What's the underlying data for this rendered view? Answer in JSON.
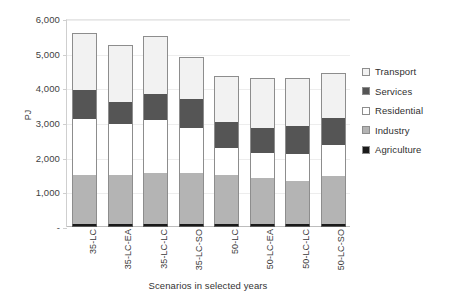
{
  "chart_data": {
    "type": "bar",
    "title": "",
    "subtitle": "",
    "xlabel": "Scenarios in selected years",
    "ylabel": "PJ",
    "ylim": [
      0,
      6000
    ],
    "ytick_values": [
      0,
      1000,
      2000,
      3000,
      4000,
      5000,
      6000
    ],
    "ytick_labels": [
      "-",
      "1,000",
      "2,000",
      "3,000",
      "4,000",
      "5,000",
      "6,000"
    ],
    "grid": true,
    "stacked": true,
    "legend_position": "right",
    "categories": [
      "35-LC",
      "35-LC-EA",
      "35-LC-LC",
      "35-LC-SO",
      "50-LC",
      "50-LC-EA",
      "50-LC-LC",
      "50-LC-SO"
    ],
    "series": [
      {
        "name": "Agriculture",
        "color": "#1a1a1a",
        "values": [
          90,
          90,
          90,
          90,
          90,
          90,
          90,
          90
        ]
      },
      {
        "name": "Industry",
        "color": "#b4b4b4",
        "values": [
          1400,
          1400,
          1460,
          1460,
          1400,
          1310,
          1230,
          1370
        ]
      },
      {
        "name": "Residential",
        "color": "#ffffff",
        "values": [
          1620,
          1470,
          1550,
          1310,
          800,
          740,
          800,
          910
        ]
      },
      {
        "name": "Services",
        "color": "#555555",
        "values": [
          850,
          640,
          730,
          820,
          730,
          730,
          790,
          790
        ]
      },
      {
        "name": "Transport",
        "color": "#f2f2f2",
        "values": [
          1640,
          1650,
          1670,
          1220,
          1330,
          1430,
          1390,
          1290
        ]
      }
    ],
    "totals": [
      5600,
      5250,
      5500,
      4900,
      4350,
      4300,
      4300,
      4450
    ]
  },
  "legend": {
    "items": [
      {
        "label": "Transport",
        "key_color": "#f2f2f2",
        "icon": "square-swatch-icon"
      },
      {
        "label": "Services",
        "key_color": "#555555",
        "icon": "square-swatch-icon"
      },
      {
        "label": "Residential",
        "key_color": "#ffffff",
        "icon": "square-swatch-icon"
      },
      {
        "label": "Industry",
        "key_color": "#b4b4b4",
        "icon": "square-swatch-icon"
      },
      {
        "label": "Agriculture",
        "key_color": "#1a1a1a",
        "icon": "square-swatch-icon"
      }
    ]
  }
}
